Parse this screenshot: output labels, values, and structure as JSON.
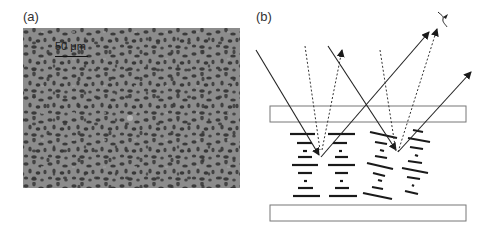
{
  "figure": {
    "panel_a": {
      "label": "(a)",
      "content": "grayscale micrograph with dark domain texture",
      "scale_bar": {
        "label": "50 μm"
      },
      "colors": {
        "background": "#8a8a8a",
        "domains": "#3c3c3c"
      }
    },
    "panel_b": {
      "label": "(b)",
      "content": "schematic of light reflection from layered domains between two plates",
      "elements": {
        "top_plate": "rectangle",
        "bottom_plate": "rectangle",
        "layer_stacks": 4,
        "solid_rays": 3,
        "dotted_rays": 2,
        "detector_mark": "squiggle"
      },
      "colors": {
        "line": "#222222",
        "plate_border": "#777777"
      }
    }
  }
}
